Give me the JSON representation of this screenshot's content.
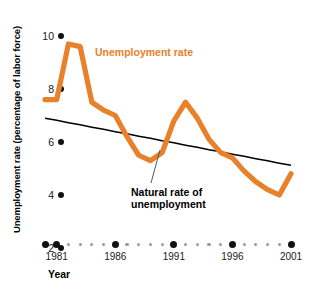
{
  "chart_data": {
    "type": "line",
    "title": "",
    "xlabel": "Year",
    "ylabel": "Unemployment rate (percentage of labor force)",
    "xlim": [
      1980,
      2001
    ],
    "ylim": [
      2,
      10
    ],
    "yticks": [
      2,
      4,
      6,
      8,
      10
    ],
    "ytick_labels": [
      "2",
      "4",
      "6",
      "8",
      "10"
    ],
    "xticks": [
      1981,
      1986,
      1991,
      1996,
      2001
    ],
    "xtick_labels": [
      "1981",
      "1986",
      "1991",
      "1996",
      "2001"
    ],
    "grid": false,
    "legend": "annotations",
    "x": [
      1980,
      1981,
      1982,
      1983,
      1984,
      1985,
      1986,
      1987,
      1988,
      1989,
      1990,
      1991,
      1992,
      1993,
      1994,
      1995,
      1996,
      1997,
      1998,
      1999,
      2000,
      2001
    ],
    "series": [
      {
        "name": "Unemployment rate",
        "color": "#E8812A",
        "style": "thick-line",
        "values": [
          7.6,
          7.6,
          9.7,
          9.6,
          7.5,
          7.2,
          7.0,
          6.2,
          5.5,
          5.3,
          5.6,
          6.8,
          7.5,
          6.9,
          6.1,
          5.6,
          5.4,
          4.9,
          4.5,
          4.2,
          4.0,
          4.8
        ]
      },
      {
        "name": "Natural rate of unemployment",
        "color": "#000000",
        "style": "thin-line",
        "values": [
          6.9,
          6.82,
          6.73,
          6.65,
          6.56,
          6.48,
          6.39,
          6.31,
          6.22,
          6.14,
          6.05,
          5.97,
          5.88,
          5.8,
          5.71,
          5.63,
          5.54,
          5.46,
          5.37,
          5.29,
          5.2,
          5.12
        ]
      }
    ],
    "annotations": [
      {
        "name": "unemployment-rate-label",
        "text": "Unemployment rate",
        "color": "#E8812A"
      },
      {
        "name": "natural-rate-label",
        "line1": "Natural rate of",
        "line2": "unemployment",
        "color": "#000000"
      }
    ],
    "minor_x_dot_years": [
      1982,
      1983,
      1984,
      1985,
      1987,
      1988,
      1989,
      1990,
      1992,
      1993,
      1994,
      1995,
      1997,
      1998,
      1999,
      2000
    ],
    "extra_left_dot": "1980"
  }
}
